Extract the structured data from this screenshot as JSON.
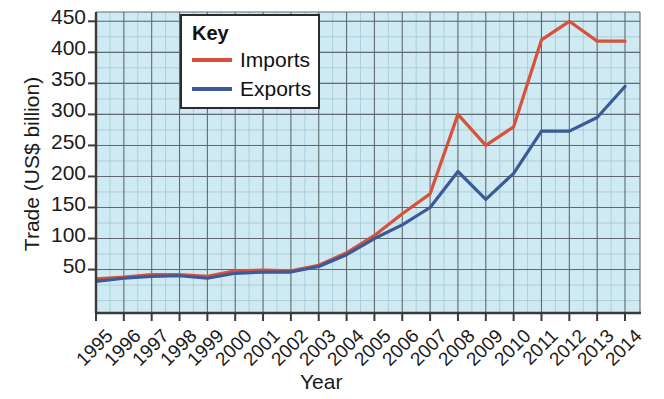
{
  "chart_data": {
    "type": "line",
    "title": "",
    "xlabel": "Year",
    "ylabel": "Trade (US$ billion)",
    "xlim": [
      1995,
      2014
    ],
    "ylim": [
      -20,
      465
    ],
    "ytick_values": [
      50,
      100,
      150,
      200,
      250,
      300,
      350,
      400,
      450
    ],
    "ytick_labels": [
      "50",
      "100",
      "150",
      "200",
      "250",
      "300",
      "350",
      "400",
      "450"
    ],
    "grid": true,
    "legend_position": "top-center",
    "legend_title": "Key",
    "plot_background": "#cfeaf2",
    "x": [
      1995,
      1996,
      1997,
      1998,
      1999,
      2000,
      2001,
      2002,
      2003,
      2004,
      2005,
      2006,
      2007,
      2008,
      2009,
      2010,
      2011,
      2012,
      2013,
      2014
    ],
    "categories": [
      "1995",
      "1996",
      "1997",
      "1998",
      "1999",
      "2000",
      "2001",
      "2002",
      "2003",
      "2004",
      "2005",
      "2006",
      "2007",
      "2008",
      "2009",
      "2010",
      "2011",
      "2012",
      "2013",
      "2014"
    ],
    "series": [
      {
        "name": "Imports",
        "color": "#d9513a",
        "values": [
          35,
          38,
          42,
          42,
          39,
          48,
          49,
          48,
          57,
          77,
          105,
          140,
          172,
          300,
          250,
          280,
          420,
          450,
          418,
          418
        ]
      },
      {
        "name": "Exports",
        "color": "#3c5a98",
        "values": [
          31,
          36,
          39,
          40,
          36,
          44,
          46,
          46,
          55,
          74,
          100,
          122,
          150,
          208,
          163,
          205,
          273,
          273,
          295,
          345
        ]
      }
    ]
  },
  "legend": {
    "title": "Key",
    "entries": [
      {
        "label": "Imports",
        "color": "#d9513a"
      },
      {
        "label": "Exports",
        "color": "#3c5a98"
      }
    ]
  },
  "axes": {
    "x_title": "Year",
    "y_title": "Trade (US$ billion)",
    "y_ticks": [
      "450",
      "400",
      "350",
      "300",
      "250",
      "200",
      "150",
      "100",
      "50"
    ],
    "x_ticks": [
      "1995",
      "1996",
      "1997",
      "1998",
      "1999",
      "2000",
      "2001",
      "2002",
      "2003",
      "2004",
      "2005",
      "2006",
      "2007",
      "2008",
      "2009",
      "2010",
      "2011",
      "2012",
      "2013",
      "2014"
    ]
  }
}
